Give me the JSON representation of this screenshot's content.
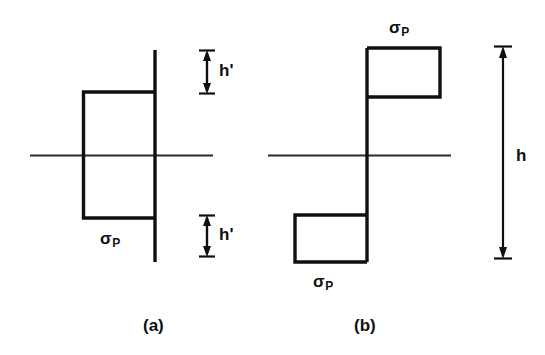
{
  "figure": {
    "type": "engineering-diagram",
    "background_color": "#ffffff",
    "line_color": "#101010",
    "parts": [
      {
        "id": "a",
        "caption": "(a)",
        "stress_label": "σ",
        "stress_subscript": "P",
        "dimension_labels": [
          "h'",
          "h'"
        ]
      },
      {
        "id": "b",
        "caption": "(b)",
        "stress_label": "σ",
        "stress_subscript": "P",
        "dimension_labels": [
          "h"
        ]
      }
    ]
  },
  "labels": {
    "sigma_a_bottom": "σ",
    "sigma_a_bottom_sub": "P",
    "sigma_b_top": "σ",
    "sigma_b_top_sub": "P",
    "sigma_b_bottom": "σ",
    "sigma_b_bottom_sub": "P",
    "h_prime_upper": "h'",
    "h_prime_lower": "h'",
    "h_overall": "h",
    "caption_a": "(a)",
    "caption_b": "(b)"
  },
  "geometry": {
    "axis_a": {
      "x1": 30,
      "y1": 155,
      "x2": 213,
      "y2": 155
    },
    "axis_b": {
      "x1": 268,
      "y1": 155,
      "x2": 451,
      "y2": 155
    },
    "vline_a": {
      "x": 155,
      "y1": 50,
      "y2": 262
    },
    "rect_a_upper": {
      "x": 83,
      "y": 92,
      "w": 72,
      "h": 63
    },
    "rect_a_lower": {
      "x": 83,
      "y": 155,
      "w": 72,
      "h": 63
    },
    "vline_b": {
      "x": 367,
      "y1": 48,
      "y2": 262
    },
    "rect_b_upper": {
      "x": 367,
      "y": 48,
      "w": 73,
      "h": 49
    },
    "rect_b_lower": {
      "x": 295,
      "y": 215,
      "w": 72,
      "h": 47
    },
    "dim_h_prime_upper": {
      "x": 207,
      "y1": 52,
      "y2": 92
    },
    "dim_h_prime_lower": {
      "x": 207,
      "y1": 215,
      "y2": 255
    },
    "dim_h": {
      "x": 503,
      "y1": 47,
      "y2": 258
    }
  },
  "colors": {
    "stroke": "#101010",
    "background": "#ffffff",
    "thin_stroke": "#2a2a2a"
  }
}
